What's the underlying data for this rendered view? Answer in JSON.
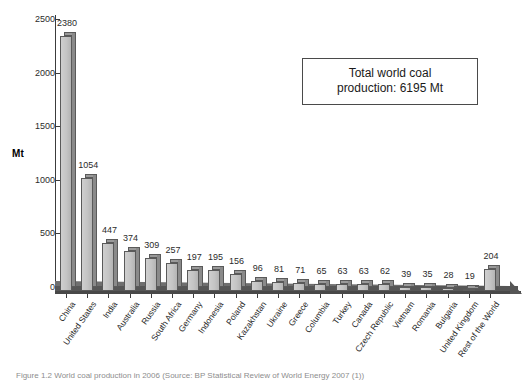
{
  "figure": {
    "background_color": "#ffffff",
    "annotation": {
      "line1": "Total world coal",
      "line2": "production: 6195 Mt"
    },
    "caption": "Figure 1.2  World coal production in 2006 (Source: BP Statistical Review of World Energy 2007 (1))"
  },
  "chart_data": {
    "type": "bar",
    "title": "",
    "xlabel": "",
    "ylabel": "Mt",
    "ylim": [
      0,
      2500
    ],
    "yticks": [
      0,
      500,
      1000,
      1500,
      2000,
      2500
    ],
    "ytick_labels": [
      "0",
      "500",
      "1000",
      "1500",
      "2000",
      "2500"
    ],
    "grid": false,
    "legend": "none",
    "units": "Mt",
    "total_label": "Total world coal production: 6195 Mt",
    "total_value": 6195,
    "bar_style": "3d",
    "bar_face_color": "#c4c4c4",
    "bar_side_color": "#8a8a8a",
    "bar_edge_color": "#5a5a5a",
    "categories": [
      "China",
      "United States",
      "India",
      "Australia",
      "Russia",
      "South Africa",
      "Germany",
      "Indonesia",
      "Poland",
      "Kazakhstan",
      "Ukraine",
      "Greece",
      "Columbia",
      "Turkey",
      "Canada",
      "Czech Republic",
      "Vietnam",
      "Romania",
      "Bulgaria",
      "United Kingdom",
      "Rest of the World"
    ],
    "values": [
      2380,
      1054,
      447,
      374,
      309,
      257,
      197,
      195,
      156,
      96,
      81,
      71,
      65,
      63,
      63,
      62,
      39,
      35,
      28,
      19,
      204
    ],
    "value_labels": [
      "2380",
      "1054",
      "447",
      "374",
      "309",
      "257",
      "197",
      "195",
      "156",
      "96",
      "81",
      "71",
      "65",
      "63",
      "63",
      "62",
      "39",
      "35",
      "28",
      "19",
      "204"
    ]
  }
}
